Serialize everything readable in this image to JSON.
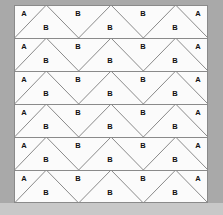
{
  "figure": {
    "title": "",
    "background_color": "#a9a9a9",
    "footer_band_color": "#c8c8c8",
    "panel": {
      "background_color": "#fbfbfb",
      "border_color": "#8a8a8a",
      "x": 14,
      "y": 5,
      "width": 194,
      "height": 198
    },
    "line_color": "#8a8a8a",
    "label_color": "#111111"
  },
  "tiling": {
    "type": "zigzag-triangle-strip",
    "rows": 6,
    "row_height": 33,
    "peaks_per_row": 3,
    "valleys_per_row": 3,
    "half_triangles_per_row": 2,
    "unit_width": 64.666,
    "labels": {
      "edge": "A",
      "interior": "B"
    },
    "row_labels": [
      {
        "index": 0,
        "cells": [
          {
            "label": "A",
            "x": 10,
            "y": 9,
            "kind": "left-half-triangle"
          },
          {
            "label": "B",
            "x": 32,
            "y": 23,
            "kind": "up-triangle"
          },
          {
            "label": "B",
            "x": 64,
            "y": 9,
            "kind": "down-triangle"
          },
          {
            "label": "B",
            "x": 96,
            "y": 23,
            "kind": "up-triangle"
          },
          {
            "label": "B",
            "x": 129,
            "y": 9,
            "kind": "down-triangle"
          },
          {
            "label": "B",
            "x": 161,
            "y": 23,
            "kind": "up-triangle"
          },
          {
            "label": "A",
            "x": 184,
            "y": 9,
            "kind": "right-half-triangle"
          }
        ]
      },
      {
        "index": 1,
        "cells": [
          {
            "label": "A",
            "x": 10,
            "y": 9,
            "kind": "left-half-triangle"
          },
          {
            "label": "B",
            "x": 32,
            "y": 23,
            "kind": "up-triangle"
          },
          {
            "label": "B",
            "x": 64,
            "y": 9,
            "kind": "down-triangle"
          },
          {
            "label": "B",
            "x": 96,
            "y": 23,
            "kind": "up-triangle"
          },
          {
            "label": "B",
            "x": 129,
            "y": 9,
            "kind": "down-triangle"
          },
          {
            "label": "B",
            "x": 161,
            "y": 23,
            "kind": "up-triangle"
          },
          {
            "label": "A",
            "x": 184,
            "y": 9,
            "kind": "right-half-triangle"
          }
        ]
      },
      {
        "index": 2,
        "cells": [
          {
            "label": "A",
            "x": 10,
            "y": 9,
            "kind": "left-half-triangle"
          },
          {
            "label": "B",
            "x": 32,
            "y": 23,
            "kind": "up-triangle"
          },
          {
            "label": "B",
            "x": 64,
            "y": 9,
            "kind": "down-triangle"
          },
          {
            "label": "B",
            "x": 96,
            "y": 23,
            "kind": "up-triangle"
          },
          {
            "label": "B",
            "x": 129,
            "y": 9,
            "kind": "down-triangle"
          },
          {
            "label": "B",
            "x": 161,
            "y": 23,
            "kind": "up-triangle"
          },
          {
            "label": "A",
            "x": 184,
            "y": 9,
            "kind": "right-half-triangle"
          }
        ]
      },
      {
        "index": 3,
        "cells": [
          {
            "label": "A",
            "x": 10,
            "y": 9,
            "kind": "left-half-triangle"
          },
          {
            "label": "B",
            "x": 32,
            "y": 23,
            "kind": "up-triangle"
          },
          {
            "label": "B",
            "x": 64,
            "y": 9,
            "kind": "down-triangle"
          },
          {
            "label": "B",
            "x": 96,
            "y": 23,
            "kind": "up-triangle"
          },
          {
            "label": "B",
            "x": 129,
            "y": 9,
            "kind": "down-triangle"
          },
          {
            "label": "B",
            "x": 161,
            "y": 23,
            "kind": "up-triangle"
          },
          {
            "label": "A",
            "x": 184,
            "y": 9,
            "kind": "right-half-triangle"
          }
        ]
      },
      {
        "index": 4,
        "cells": [
          {
            "label": "A",
            "x": 10,
            "y": 9,
            "kind": "left-half-triangle"
          },
          {
            "label": "B",
            "x": 32,
            "y": 23,
            "kind": "up-triangle"
          },
          {
            "label": "B",
            "x": 64,
            "y": 9,
            "kind": "down-triangle"
          },
          {
            "label": "B",
            "x": 96,
            "y": 23,
            "kind": "up-triangle"
          },
          {
            "label": "B",
            "x": 129,
            "y": 9,
            "kind": "down-triangle"
          },
          {
            "label": "B",
            "x": 161,
            "y": 23,
            "kind": "up-triangle"
          },
          {
            "label": "A",
            "x": 184,
            "y": 9,
            "kind": "right-half-triangle"
          }
        ]
      },
      {
        "index": 5,
        "cells": [
          {
            "label": "A",
            "x": 10,
            "y": 9,
            "kind": "left-half-triangle"
          },
          {
            "label": "B",
            "x": 32,
            "y": 23,
            "kind": "up-triangle"
          },
          {
            "label": "B",
            "x": 64,
            "y": 9,
            "kind": "down-triangle"
          },
          {
            "label": "B",
            "x": 96,
            "y": 23,
            "kind": "up-triangle"
          },
          {
            "label": "B",
            "x": 129,
            "y": 9,
            "kind": "down-triangle"
          },
          {
            "label": "B",
            "x": 161,
            "y": 23,
            "kind": "up-triangle"
          },
          {
            "label": "A",
            "x": 184,
            "y": 9,
            "kind": "right-half-triangle"
          }
        ]
      }
    ]
  }
}
